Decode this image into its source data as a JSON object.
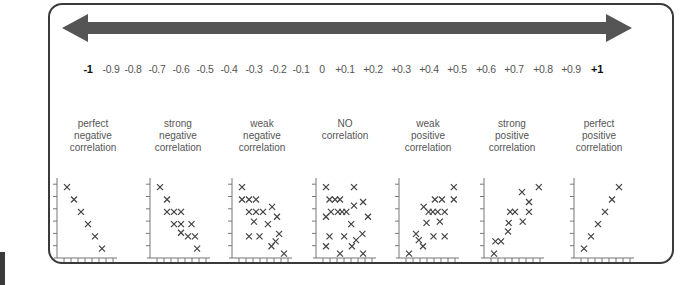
{
  "arrow": {
    "color": "#555555",
    "direction": "bidirectional"
  },
  "scale": {
    "ticks": [
      {
        "label": "-1",
        "bold": true,
        "x": 88
      },
      {
        "label": "-0.9",
        "bold": false,
        "x": 111
      },
      {
        "label": "-0.8",
        "bold": false,
        "x": 133
      },
      {
        "label": "-0.7",
        "bold": false,
        "x": 157
      },
      {
        "label": "-0.6",
        "bold": false,
        "x": 181
      },
      {
        "label": "-0.5",
        "bold": false,
        "x": 205
      },
      {
        "label": "-0.4",
        "bold": false,
        "x": 229
      },
      {
        "label": "-0.3",
        "bold": false,
        "x": 254
      },
      {
        "label": "-0.2",
        "bold": false,
        "x": 278
      },
      {
        "label": "-0.1",
        "bold": false,
        "x": 301
      },
      {
        "label": "0",
        "bold": false,
        "x": 322
      },
      {
        "label": "+0.1",
        "bold": false,
        "x": 345
      },
      {
        "label": "+0.2",
        "bold": false,
        "x": 373
      },
      {
        "label": "+0.3",
        "bold": false,
        "x": 401
      },
      {
        "label": "+0.4",
        "bold": false,
        "x": 429
      },
      {
        "label": "+0.5",
        "bold": false,
        "x": 457
      },
      {
        "label": "+0.6",
        "bold": false,
        "x": 486
      },
      {
        "label": "+0.7",
        "bold": false,
        "x": 514
      },
      {
        "label": "+0.8",
        "bold": false,
        "x": 543
      },
      {
        "label": "+0.9",
        "bold": false,
        "x": 571
      },
      {
        "label": "+1",
        "bold": true,
        "x": 597
      }
    ]
  },
  "categories": [
    {
      "lines": [
        "perfect",
        "negative",
        "correlation"
      ],
      "cx": 93
    },
    {
      "lines": [
        "strong",
        "negative",
        "correlation"
      ],
      "cx": 178
    },
    {
      "lines": [
        "weak",
        "negative",
        "correlation"
      ],
      "cx": 262
    },
    {
      "lines": [
        "NO",
        "correlation",
        ""
      ],
      "cx": 345
    },
    {
      "lines": [
        "weak",
        "positive",
        "correlation"
      ],
      "cx": 428
    },
    {
      "lines": [
        "strong",
        "positive",
        "correlation"
      ],
      "cx": 512
    },
    {
      "lines": [
        "perfect",
        "positive",
        "correlation"
      ],
      "cx": 599
    }
  ],
  "chart_data": {
    "type": "scatter",
    "scale_range": [
      -1,
      1
    ],
    "scale_step": 0.1,
    "plots": [
      {
        "name": "perfect negative correlation",
        "axis_x": 57,
        "points": [
          [
            1,
            6
          ],
          [
            2,
            5
          ],
          [
            3,
            4
          ],
          [
            4,
            3
          ],
          [
            5,
            2
          ],
          [
            6,
            1
          ]
        ]
      },
      {
        "name": "strong negative correlation",
        "axis_x": 150,
        "points": [
          [
            1,
            6
          ],
          [
            2,
            5
          ],
          [
            2,
            4
          ],
          [
            3,
            4
          ],
          [
            4,
            4
          ],
          [
            3,
            3
          ],
          [
            4,
            3
          ],
          [
            5.5,
            3
          ],
          [
            4,
            2.3
          ],
          [
            5,
            2
          ],
          [
            6,
            2
          ],
          [
            6.3,
            1
          ]
        ]
      },
      {
        "name": "weak negative correlation",
        "axis_x": 232,
        "points": [
          [
            1,
            6
          ],
          [
            1,
            5
          ],
          [
            2,
            5
          ],
          [
            3,
            5
          ],
          [
            2,
            4
          ],
          [
            3,
            4
          ],
          [
            4,
            4
          ],
          [
            5.3,
            4.4
          ],
          [
            6,
            3.6
          ],
          [
            2.7,
            3.2
          ],
          [
            4.7,
            3
          ],
          [
            2,
            2
          ],
          [
            3.5,
            2
          ],
          [
            6.3,
            2.2
          ],
          [
            5.8,
            1.6
          ],
          [
            5.2,
            1.2
          ],
          [
            7,
            0.6
          ]
        ]
      },
      {
        "name": "NO correlation",
        "axis_x": 316,
        "points": [
          [
            1,
            6
          ],
          [
            5,
            6
          ],
          [
            1.5,
            5
          ],
          [
            2.3,
            5
          ],
          [
            3,
            5
          ],
          [
            5,
            4.5
          ],
          [
            6.3,
            4.8
          ],
          [
            1,
            3.6
          ],
          [
            1.7,
            4
          ],
          [
            2.7,
            4
          ],
          [
            3.3,
            4
          ],
          [
            3.9,
            4
          ],
          [
            7,
            3.6
          ],
          [
            4.6,
            3
          ],
          [
            1.5,
            2
          ],
          [
            3.6,
            2
          ],
          [
            6.2,
            2.2
          ],
          [
            5.3,
            1.7
          ],
          [
            1,
            1.2
          ],
          [
            4.7,
            1.2
          ],
          [
            3,
            0.6
          ],
          [
            6.3,
            0.6
          ]
        ]
      },
      {
        "name": "weak positive correlation",
        "axis_x": 399,
        "points": [
          [
            7.4,
            6
          ],
          [
            4.7,
            5
          ],
          [
            5.7,
            5
          ],
          [
            7.4,
            5
          ],
          [
            3.1,
            4.4
          ],
          [
            3.8,
            4
          ],
          [
            4.4,
            4
          ],
          [
            5.1,
            4
          ],
          [
            6.1,
            4
          ],
          [
            3.5,
            3.1
          ],
          [
            5.4,
            3.2
          ],
          [
            2,
            2.2
          ],
          [
            2.4,
            1.7
          ],
          [
            3,
            1.2
          ],
          [
            4.5,
            2
          ],
          [
            6.1,
            2
          ],
          [
            1,
            0.6
          ]
        ]
      },
      {
        "name": "strong positive correlation",
        "axis_x": 484,
        "points": [
          [
            7.4,
            6
          ],
          [
            5,
            5.6
          ],
          [
            6,
            4.8
          ],
          [
            3.3,
            4
          ],
          [
            4,
            4
          ],
          [
            6,
            4
          ],
          [
            5.1,
            3.2
          ],
          [
            3.1,
            3.1
          ],
          [
            3,
            2.4
          ],
          [
            1.2,
            1.6
          ],
          [
            2,
            1.6
          ],
          [
            1,
            0.6
          ]
        ]
      },
      {
        "name": "perfect positive correlation",
        "axis_x": 574,
        "points": [
          [
            1,
            1
          ],
          [
            2,
            2
          ],
          [
            3,
            3
          ],
          [
            4,
            4
          ],
          [
            5,
            5
          ],
          [
            6,
            6
          ]
        ]
      }
    ],
    "xlabel": "",
    "ylabel": "",
    "grid": false,
    "legend": "none"
  },
  "style": {
    "frame_color": "#3a3a3a",
    "point_color": "#444444",
    "axis_color": "#777777"
  }
}
